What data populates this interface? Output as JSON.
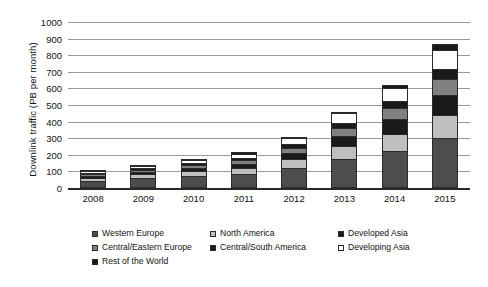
{
  "chart_data": {
    "type": "bar",
    "subtype": "stacked-bar",
    "title": "",
    "xlabel": "",
    "ylabel": "Downlink traffic (PB per month)",
    "ylim": [
      0,
      1000
    ],
    "ytick_step": 100,
    "yticks": [
      "1000",
      "900",
      "800",
      "700",
      "600",
      "500",
      "400",
      "300",
      "200",
      "100",
      "0"
    ],
    "grid": true,
    "legend_position": "bottom",
    "categories": [
      "2008",
      "2009",
      "2010",
      "2011",
      "2012",
      "2013",
      "2014",
      "2015"
    ],
    "series": [
      {
        "name": "Western Europe",
        "color": "#4d4d4d",
        "values": [
          45,
          60,
          72,
          85,
          120,
          175,
          220,
          300
        ]
      },
      {
        "name": "North America",
        "color": "#bfbfbf",
        "values": [
          18,
          22,
          28,
          35,
          52,
          78,
          105,
          140
        ]
      },
      {
        "name": "Developed Asia",
        "color": "#1a1a1a",
        "values": [
          12,
          15,
          20,
          24,
          38,
          60,
          88,
          120
        ]
      },
      {
        "name": "Central/Eastern Europe",
        "color": "#808080",
        "values": [
          10,
          13,
          17,
          22,
          33,
          48,
          68,
          95
        ]
      },
      {
        "name": "Central/South America",
        "color": "#1a1a1a",
        "values": [
          6,
          8,
          11,
          14,
          22,
          32,
          45,
          62
        ]
      },
      {
        "name": "Developing Asia",
        "color": "#ffffff",
        "values": [
          11,
          15,
          21,
          28,
          38,
          57,
          78,
          115
        ]
      },
      {
        "name": "Rest of the World",
        "color": "#1a1a1a",
        "values": [
          3,
          5,
          6,
          7,
          7,
          10,
          16,
          33
        ]
      }
    ],
    "totals": [
      105,
      138,
      175,
      215,
      310,
      460,
      620,
      865
    ]
  },
  "legend": {
    "items": [
      {
        "label": "Western Europe",
        "swatch": "#4d4d4d"
      },
      {
        "label": "North America",
        "swatch": "#bfbfbf"
      },
      {
        "label": "Developed Asia",
        "swatch": "#1a1a1a"
      },
      {
        "label": "Central/Eastern Europe",
        "swatch": "#808080"
      },
      {
        "label": "Central/South America",
        "swatch": "#1a1a1a"
      },
      {
        "label": "Developing Asia",
        "swatch": "#ffffff"
      },
      {
        "label": "Rest of the World",
        "swatch": "#1a1a1a"
      }
    ]
  }
}
